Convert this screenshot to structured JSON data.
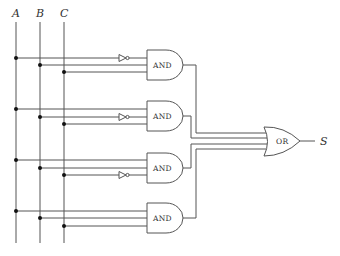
{
  "diagram": {
    "type": "logic-circuit",
    "inputs": [
      {
        "label": "A",
        "x": 16
      },
      {
        "label": "B",
        "x": 40
      },
      {
        "label": "C",
        "x": 64
      }
    ],
    "and_gates": [
      {
        "label": "AND",
        "inverted_input": "A",
        "rows": [
          58,
          65,
          72
        ],
        "out_y": 65
      },
      {
        "label": "AND",
        "inverted_input": "B",
        "rows": [
          109,
          117,
          124
        ],
        "out_y": 116
      },
      {
        "label": "AND",
        "inverted_input": "C",
        "rows": [
          160,
          168,
          175
        ],
        "out_y": 168
      },
      {
        "label": "AND",
        "inverted_input": null,
        "rows": [
          211,
          218,
          226
        ],
        "out_y": 218
      }
    ],
    "or_gate": {
      "label": "OR"
    },
    "output": {
      "label": "S"
    }
  }
}
